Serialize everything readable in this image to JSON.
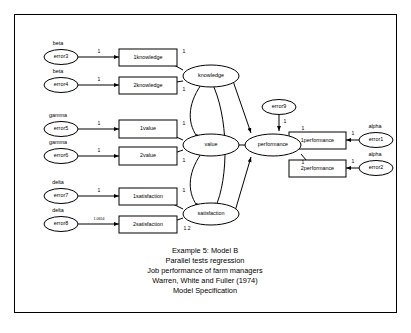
{
  "diagram": {
    "frame": {
      "border_color": "#000000"
    },
    "observed_variables": [
      {
        "id": "k1",
        "label": "1knowledge",
        "x": 133,
        "y": 56
      },
      {
        "id": "k2",
        "label": "2knowledge",
        "x": 133,
        "y": 84
      },
      {
        "id": "v1",
        "label": "1value",
        "x": 133,
        "y": 128
      },
      {
        "id": "v2",
        "label": "2value",
        "x": 133,
        "y": 155
      },
      {
        "id": "s1",
        "label": "1satisfaction",
        "x": 133,
        "y": 195
      },
      {
        "id": "s2",
        "label": "2satisfaction",
        "x": 133,
        "y": 223
      },
      {
        "id": "p1",
        "label": "1performance",
        "x": 317,
        "y": 139
      },
      {
        "id": "p2",
        "label": "2performance",
        "x": 317,
        "y": 167
      }
    ],
    "latent_variables": [
      {
        "id": "knowledge",
        "label": "knowledge",
        "x": 198,
        "y": 75
      },
      {
        "id": "value",
        "label": "value",
        "x": 198,
        "y": 144
      },
      {
        "id": "satisfaction",
        "label": "satisfaction",
        "x": 198,
        "y": 213
      },
      {
        "id": "performance",
        "label": "performance",
        "x": 264,
        "y": 144
      }
    ],
    "error_terms": [
      {
        "id": "error3",
        "label": "error3",
        "x": 61,
        "y": 56,
        "greek": "beta"
      },
      {
        "id": "error4",
        "label": "error4",
        "x": 61,
        "y": 84,
        "greek": "beta"
      },
      {
        "id": "error5",
        "label": "error5",
        "x": 61,
        "y": 128,
        "greek": "gamma"
      },
      {
        "id": "error6",
        "label": "error6",
        "x": 61,
        "y": 155,
        "greek": "gamma"
      },
      {
        "id": "error7",
        "label": "error7",
        "x": 61,
        "y": 195,
        "greek": "delta"
      },
      {
        "id": "error8",
        "label": "error8",
        "x": 61,
        "y": 223,
        "greek": "delta"
      },
      {
        "id": "error9",
        "label": "error9",
        "x": 264,
        "y": 106,
        "greek": ""
      },
      {
        "id": "error1",
        "label": "error1",
        "x": 373,
        "y": 139,
        "greek": "alpha"
      },
      {
        "id": "error2",
        "label": "error2",
        "x": 373,
        "y": 167,
        "greek": "alpha"
      }
    ],
    "coefficients": {
      "error3_to_k1": "1",
      "error4_to_k2": "1",
      "error5_to_v1": "1",
      "error6_to_v2": "1",
      "error7_to_s1": "1",
      "error8_to_s2": "1.0654",
      "error9_to_performance": "1",
      "error1_to_p1": "1",
      "error2_to_p2": "1",
      "knowledge_to_k1": "1",
      "knowledge_to_k2": "1",
      "value_to_v1": "1",
      "value_to_v2": "1",
      "satisfaction_to_s1": "1",
      "satisfaction_to_s2": "1.2",
      "performance_to_p1": "1",
      "performance_to_p2": "1"
    },
    "caption": [
      "Example 5: Model B",
      "Parallel tests regression",
      "Job performance of farm managers",
      "Warren, White and Fuller (1974)",
      "Model Specification"
    ]
  }
}
